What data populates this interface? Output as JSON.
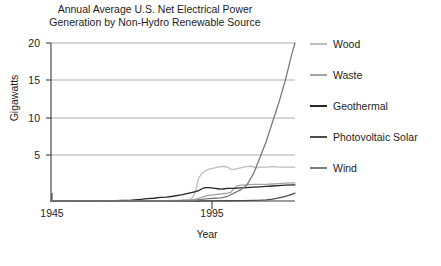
{
  "figure": {
    "title_line1": "Annual Average U.S. Net Electrical Power",
    "title_line2": "Generation by Non-Hydro Renewable Source"
  },
  "axes": {
    "ylabel": "Gigawatts",
    "xlabel": "Year",
    "yticks": [
      "20",
      "15",
      "10",
      "5"
    ],
    "xticks": [
      "1945",
      "1995"
    ]
  },
  "legend": {
    "items": [
      {
        "label": "Wood",
        "color": "#bdbdbd"
      },
      {
        "label": "Waste",
        "color": "#a3a3a3"
      },
      {
        "label": "Geothermal",
        "color": "#262626"
      },
      {
        "label": "Photovoltaic Solar",
        "color": "#4d4d4d"
      },
      {
        "label": "Wind",
        "color": "#7a7a7a"
      }
    ]
  },
  "chart_data": {
    "type": "line",
    "title": "Annual Average U.S. Net Electrical Power Generation by Non-Hydro Renewable Source",
    "xlabel": "Year",
    "ylabel": "Gigawatts",
    "xlim": [
      1945,
      2021
    ],
    "ylim": [
      0,
      20
    ],
    "yticks": [
      5,
      10,
      15,
      20
    ],
    "xticks": [
      1945,
      1995
    ],
    "grid": "horizontal",
    "legend_position": "right",
    "series": [
      {
        "name": "Wood",
        "color": "#bdbdbd",
        "x": [
          1945,
          1960,
          1970,
          1980,
          1985,
          1988,
          1989,
          1990,
          1991,
          1992,
          1993,
          1994,
          1995,
          1996,
          1997,
          1998,
          1999,
          2000,
          2001,
          2002,
          2003,
          2004,
          2005,
          2006,
          2007,
          2008,
          2009,
          2010,
          2012,
          2014,
          2016,
          2018,
          2021
        ],
        "y": [
          0.0,
          0.0,
          0.0,
          0.05,
          0.1,
          0.2,
          0.4,
          1.2,
          2.9,
          3.5,
          3.8,
          4.0,
          4.1,
          4.2,
          4.3,
          4.35,
          4.35,
          4.3,
          4.0,
          4.0,
          4.1,
          4.2,
          4.3,
          4.35,
          4.4,
          4.35,
          4.2,
          4.3,
          4.3,
          4.35,
          4.3,
          4.3,
          4.3
        ]
      },
      {
        "name": "Waste",
        "color": "#a3a3a3",
        "x": [
          1945,
          1970,
          1980,
          1985,
          1988,
          1989,
          1990,
          1991,
          1992,
          1993,
          1994,
          1995,
          1996,
          1997,
          1998,
          1999,
          2000,
          2001,
          2002,
          2003,
          2004,
          2006,
          2008,
          2010,
          2012,
          2014,
          2016,
          2018,
          2021
        ],
        "y": [
          0.0,
          0.0,
          0.0,
          0.05,
          0.1,
          0.15,
          0.2,
          0.35,
          0.5,
          0.6,
          0.7,
          0.75,
          0.8,
          0.85,
          0.9,
          0.95,
          1.0,
          1.1,
          1.6,
          1.9,
          2.0,
          2.05,
          2.1,
          2.1,
          2.1,
          2.15,
          2.2,
          2.25,
          2.3
        ]
      },
      {
        "name": "Geothermal",
        "color": "#262626",
        "x": [
          1945,
          1960,
          1965,
          1970,
          1973,
          1975,
          1977,
          1979,
          1981,
          1983,
          1985,
          1986,
          1987,
          1988,
          1989,
          1990,
          1991,
          1992,
          1993,
          1994,
          1995,
          1996,
          1997,
          1998,
          1999,
          2000,
          2002,
          2004,
          2006,
          2008,
          2010,
          2012,
          2014,
          2016,
          2018,
          2021
        ],
        "y": [
          0.0,
          0.0,
          0.05,
          0.1,
          0.2,
          0.3,
          0.35,
          0.45,
          0.5,
          0.6,
          0.75,
          0.8,
          0.9,
          1.0,
          1.1,
          1.2,
          1.3,
          1.55,
          1.7,
          1.7,
          1.65,
          1.6,
          1.55,
          1.5,
          1.55,
          1.6,
          1.6,
          1.65,
          1.7,
          1.75,
          1.8,
          1.85,
          1.9,
          1.95,
          2.0,
          2.05
        ]
      },
      {
        "name": "Photovoltaic Solar",
        "color": "#4d4d4d",
        "x": [
          1945,
          1980,
          1985,
          1990,
          1995,
          2000,
          2005,
          2008,
          2010,
          2012,
          2014,
          2016,
          2018,
          2019,
          2020,
          2021
        ],
        "y": [
          0.0,
          0.0,
          0.0,
          0.0,
          0.02,
          0.03,
          0.05,
          0.07,
          0.1,
          0.15,
          0.25,
          0.4,
          0.6,
          0.7,
          0.85,
          1.0
        ]
      },
      {
        "name": "Wind",
        "color": "#7a7a7a",
        "x": [
          1945,
          1985,
          1988,
          1990,
          1992,
          1994,
          1996,
          1998,
          2000,
          2002,
          2004,
          2006,
          2008,
          2010,
          2012,
          2014,
          2016,
          2018,
          2020,
          2021
        ],
        "y": [
          0.0,
          0.02,
          0.05,
          0.1,
          0.2,
          0.3,
          0.35,
          0.4,
          0.6,
          1.0,
          1.4,
          2.0,
          3.4,
          5.4,
          7.5,
          10.0,
          12.5,
          15.3,
          18.6,
          20.0
        ]
      }
    ]
  }
}
